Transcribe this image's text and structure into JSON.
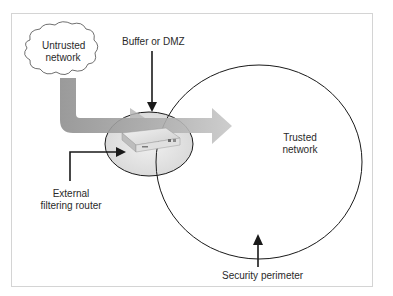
{
  "diagram": {
    "labels": {
      "untrusted_line1": "Untrusted",
      "untrusted_line2": "network",
      "buffer": "Buffer or DMZ",
      "trusted_line1": "Trusted",
      "trusted_line2": "network",
      "router_line1": "External",
      "router_line2": "filtering router",
      "perimeter": "Security perimeter"
    },
    "colors": {
      "traffic_arrow": "#9a9a9a",
      "traffic_arrow_light": "#c4c4c4",
      "dmz_fill": "#e6e6e6",
      "outline": "#1a1a1a",
      "frame_border": "#d4d4d4"
    }
  }
}
